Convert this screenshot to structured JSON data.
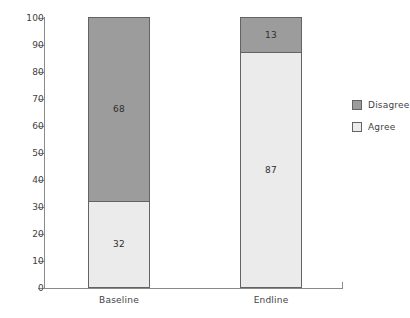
{
  "chart_data": {
    "type": "bar",
    "subtype": "stacked-100-percent",
    "title": "",
    "xlabel": "",
    "ylabel": "",
    "categories": [
      "Baseline",
      "Endline"
    ],
    "series": [
      {
        "name": "Agree",
        "values": [
          32,
          87
        ],
        "color": "#ebebeb"
      },
      {
        "name": "Disagree",
        "values": [
          68,
          13
        ],
        "color": "#9c9c9c"
      }
    ],
    "ylim": [
      0,
      100
    ],
    "y_ticks": [
      0,
      10,
      20,
      30,
      40,
      50,
      60,
      70,
      80,
      90,
      100
    ],
    "y_tick_labels": [
      "0",
      "10",
      "20",
      "30",
      "40",
      "50",
      "60",
      "70",
      "80",
      "90",
      "100"
    ],
    "grid": false,
    "legend_position": "right",
    "legend_entries": [
      "Disagree",
      "Agree"
    ],
    "data_labels": {
      "baseline_disagree": "68",
      "baseline_agree": "32",
      "endline_disagree": "13",
      "endline_agree": "87"
    }
  },
  "axis": {
    "line_color": "#8a8a8a",
    "tick_color": "#8a8a8a",
    "label_color": "#3f3f3f"
  },
  "bars": [
    {
      "category": "Baseline",
      "segments": [
        {
          "name": "Disagree",
          "value": 68,
          "label": "68",
          "color": "#9c9c9c"
        },
        {
          "name": "Agree",
          "value": 32,
          "label": "32",
          "color": "#ebebeb"
        }
      ]
    },
    {
      "category": "Endline",
      "segments": [
        {
          "name": "Disagree",
          "value": 13,
          "label": "13",
          "color": "#9c9c9c"
        },
        {
          "name": "Agree",
          "value": 87,
          "label": "87",
          "color": "#ebebeb"
        }
      ]
    }
  ],
  "legend": {
    "items": [
      {
        "label": "Disagree",
        "color": "#9c9c9c"
      },
      {
        "label": "Agree",
        "color": "#ebebeb"
      }
    ]
  }
}
